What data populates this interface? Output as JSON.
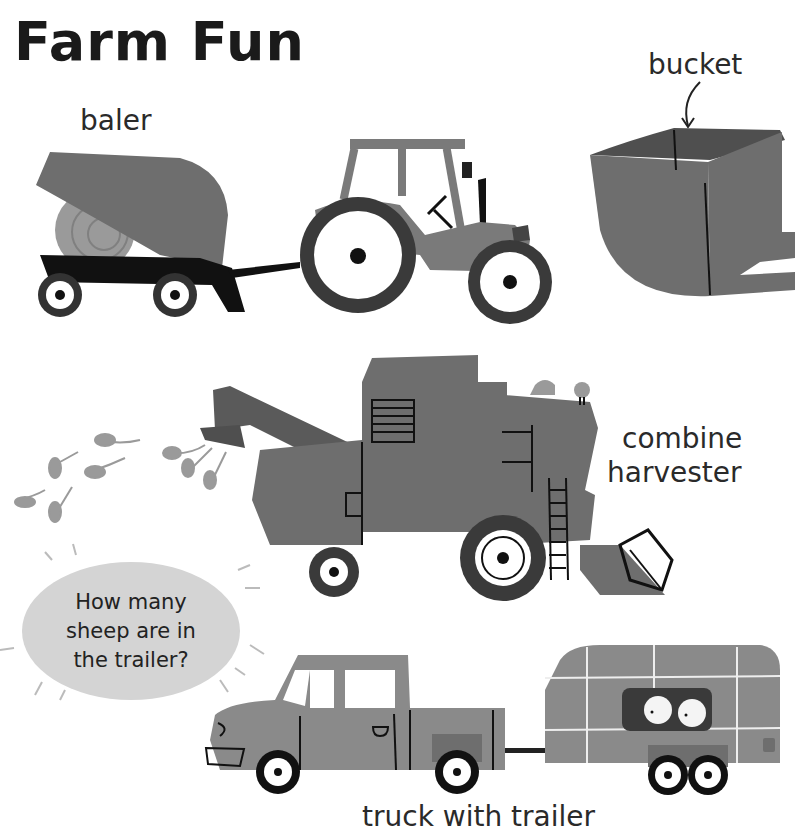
{
  "page": {
    "title": "Farm Fun"
  },
  "labels": {
    "baler": "baler",
    "bucket": "bucket",
    "combine_line1": "combine",
    "combine_line2": "harvester",
    "truck": "truck with trailer"
  },
  "question_bubble": {
    "text": "How many sheep are in the trailer?"
  },
  "illustrations": [
    {
      "name": "baler",
      "icon": "baler-icon"
    },
    {
      "name": "tractor",
      "icon": "tractor-icon"
    },
    {
      "name": "bucket",
      "icon": "bucket-icon"
    },
    {
      "name": "combine harvester",
      "icon": "combine-harvester-icon"
    },
    {
      "name": "wheat stalks",
      "icon": "wheat-icon"
    },
    {
      "name": "bird",
      "icon": "bird-icon"
    },
    {
      "name": "pickup truck",
      "icon": "truck-icon"
    },
    {
      "name": "trailer with sheep",
      "icon": "trailer-icon",
      "sheep_visible": 2
    }
  ],
  "colors": {
    "body_gray": "#6e6e6e",
    "dark_gray": "#4f4f4f",
    "light_gray": "#9a9a9a",
    "bubble_gray": "#d4d4d4",
    "ink": "#111111"
  }
}
